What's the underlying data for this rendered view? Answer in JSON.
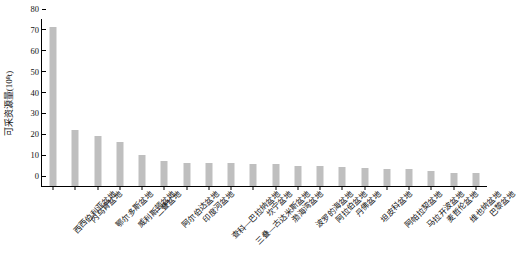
{
  "chart_data": {
    "type": "bar",
    "title": "",
    "xlabel": "",
    "ylabel": "可采资源量(10⁸t)",
    "ylim": [
      0,
      80
    ],
    "yticks": [
      0,
      10,
      20,
      30,
      40,
      50,
      60,
      70,
      80
    ],
    "grid": false,
    "legend": "none",
    "bar_color": "#bfbfbf",
    "axis_color": "#000000",
    "categories": [
      "西西伯利亚盆地",
      "内乌肯盆地",
      "鄂尔多斯盆地",
      "威利斯顿盆地",
      "二叠盆地",
      "阿尔伯达盆地",
      "印度河盆地",
      "查科—巴拉纳盆地",
      "三叠—古达米斯盆地",
      "坎宁盆地",
      "渤海湾盆地",
      "波罗的海盆地",
      "阿拉伯盆地",
      "丹佛盆地",
      "坦皮科盆地",
      "阿帕拉契盆地",
      "马拉开波盆地",
      "麦哲伦盆地",
      "维也纳盆地",
      "巴黎盆地"
    ],
    "values": [
      76,
      27,
      24,
      21,
      15,
      12,
      11,
      11,
      11,
      10.5,
      10.5,
      9.5,
      9.5,
      9,
      8.5,
      8,
      8,
      7,
      6,
      6
    ]
  }
}
